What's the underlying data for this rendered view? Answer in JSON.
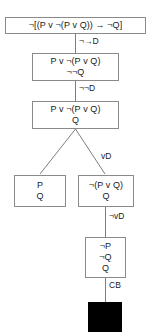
{
  "diagram": {
    "type": "truth-tree-proof",
    "nodes": [
      {
        "id": "root",
        "lines": [
          "¬[(P v ¬(P v Q)) → ¬Q]"
        ]
      },
      {
        "id": "n2",
        "lines": [
          "P v ¬(P v Q)",
          "¬¬Q"
        ]
      },
      {
        "id": "n3",
        "lines": [
          "P v ¬(P v Q)",
          "Q"
        ]
      },
      {
        "id": "n4-left",
        "lines": [
          "P",
          "Q"
        ]
      },
      {
        "id": "n4-right",
        "lines": [
          "¬(P v Q)",
          "Q"
        ]
      },
      {
        "id": "n5",
        "lines": [
          "¬P",
          "¬Q",
          "Q"
        ]
      }
    ],
    "rules": [
      {
        "id": "rule-1",
        "label": "¬→D"
      },
      {
        "id": "rule-2",
        "label": "¬¬D"
      },
      {
        "id": "rule-3",
        "label": "vD"
      },
      {
        "id": "rule-4",
        "label": "¬vD"
      },
      {
        "id": "rule-5",
        "label": "CB"
      }
    ],
    "closure_marker": {
      "id": "closed-branch",
      "symbol": "■"
    },
    "colors": {
      "border": "#8a8a8a",
      "edge": "#7d7d7d",
      "text": "#1a1a1a",
      "background": "#ffffff",
      "closure": "#000000"
    }
  }
}
